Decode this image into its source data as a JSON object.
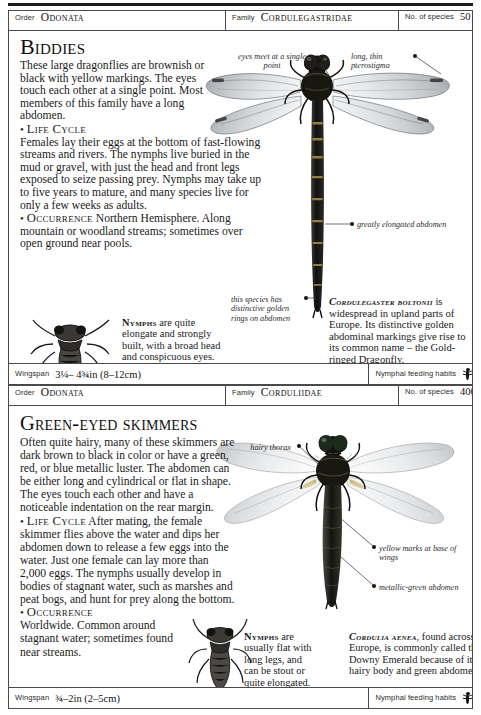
{
  "entries": [
    {
      "header": {
        "order_label": "Order",
        "order_value": "Odonata",
        "family_label": "Family",
        "family_value": "Cordulegastridae",
        "species_label": "No. of species",
        "species_value": "50"
      },
      "headline": "Biddies",
      "intro": "These large dragonflies are brownish or black with yellow markings. The eyes touch each other at a single point. Most members of this family have a long abdomen.",
      "life_cycle_label": "Life Cycle",
      "life_cycle": "Females lay their eggs at the bottom of fast-flowing streams and rivers. The nymphs live buried in the mud or gravel, with just the head and front legs exposed to seize passing prey. Nymphs may take up to five years to mature, and many species live for only a few weeks as adults.",
      "occurrence_label": "Occurrence",
      "occurrence": "Northern Hemisphere. Along mountain or woodland streams; sometimes over open ground near pools.",
      "nymph_label": "Nymphs",
      "nymph_text": "are quite elongate and strongly built, with a broad head and conspicuous eyes.",
      "species_name": "Cordulegaster boltonii",
      "species_text": "is widespread in upland parts of Europe. Its distinctive golden abdominal markings give rise to its common name – the Gold-ringed Dragonfly.",
      "annotations": [
        "eyes meet at a single point",
        "long, thin pterostigma",
        "greatly elongated abdomen",
        "this species has distinctive golden rings on abdomen"
      ],
      "footer": {
        "wingspan_label": "Wingspan",
        "wingspan_value": "3¼– 4¾in (8–12cm)",
        "feeding_label": "Nymphal feeding habits",
        "feeding_icon": "nymph-icon"
      }
    },
    {
      "header": {
        "order_label": "Order",
        "order_value": "Odonata",
        "family_label": "Family",
        "family_value": "Corduliidae",
        "species_label": "No. of species",
        "species_value": "400"
      },
      "headline": "Green-eyed skimmers",
      "intro": "Often quite hairy, many of these skimmers are dark brown to black in color or have a green, red, or blue metallic luster. The abdomen can be either long and cylindrical or flat in shape. The eyes touch each other and have a noticeable indentation on the rear margin.",
      "life_cycle_label": "Life Cycle",
      "life_cycle": "After mating, the female skimmer flies above the water and dips her abdomen down to release a few eggs into the water. Just one female can lay more than 2,000 eggs. The nymphs usually develop in bodies of stagnant water, such as marshes and peat bogs, and hunt for prey along the bottom.",
      "occurrence_label": "Occurrence",
      "occurrence": "Worldwide. Common around stagnant water; sometimes found near streams.",
      "nymph_label": "Nymphs",
      "nymph_text": "are usually flat with long legs, and can be stout or quite elongated.",
      "species_name": "Cordulia aenea",
      "species_text": ", found across Europe, is commonly called the Downy Emerald because of its hairy body and green abdomen.",
      "annotations": [
        "hairy thorax",
        "yellow marks at base of wings",
        "metallic-green abdomen"
      ],
      "footer": {
        "wingspan_label": "Wingspan",
        "wingspan_value": "¾–2in (2–5cm)",
        "feeding_label": "Nymphal feeding habits",
        "feeding_icon": "nymph-icon"
      }
    }
  ],
  "colors": {
    "ink": "#1a1a1a",
    "rule": "#4a4a4a",
    "paper": "#ffffff",
    "wing": "#b9bcbf"
  }
}
